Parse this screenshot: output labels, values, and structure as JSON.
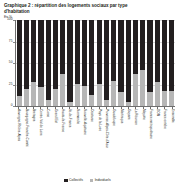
{
  "chart_data": {
    "type": "bar",
    "subtype": "stacked-100-percent",
    "title": "Graphique 2 : répartition des logements sociaux par type d'habitation",
    "unit_label": "En %",
    "xlabel": "",
    "ylabel": "",
    "ylim": [
      0,
      100
    ],
    "yticks": [
      0,
      25,
      50,
      75,
      100
    ],
    "ytick_labels": [
      "0",
      "25",
      "50",
      "75",
      "100"
    ],
    "grid": true,
    "legend_position": "bottom",
    "categories": [
      "Auvergne-Rhône-Alpes",
      "Bourgogne-Franche-Comté",
      "Bretagne",
      "Centre-Val de Loire",
      "Corse",
      "Grand Est",
      "Hauts-de-France",
      "Île-de-France",
      "Normandie",
      "Nouvelle-Aquitaine",
      "Occitanie",
      "Pays de la Loire",
      "Provence-Alpes-Côte d'Azur",
      "Guadeloupe",
      "Martinique",
      "Guyane",
      "La Réunion",
      "Mayotte",
      "France métropolitaine",
      "DOM",
      "France entière",
      "Ensemble"
    ],
    "series": [
      {
        "name": "Collectifs",
        "color": "#231f20",
        "values": [
          88,
          80,
          72,
          78,
          93,
          80,
          62,
          95,
          74,
          76,
          87,
          74,
          92,
          70,
          83,
          95,
          62,
          58,
          83,
          72,
          82,
          82
        ]
      },
      {
        "name": "Individuels",
        "color": "#b6b6b6",
        "values": [
          12,
          20,
          28,
          22,
          7,
          20,
          38,
          5,
          26,
          24,
          13,
          26,
          8,
          30,
          17,
          5,
          38,
          42,
          17,
          28,
          18,
          18
        ]
      }
    ],
    "legend": [
      {
        "label": "Collectifs",
        "color": "#231f20"
      },
      {
        "label": "Individuels",
        "color": "#b6b6b6"
      }
    ]
  }
}
